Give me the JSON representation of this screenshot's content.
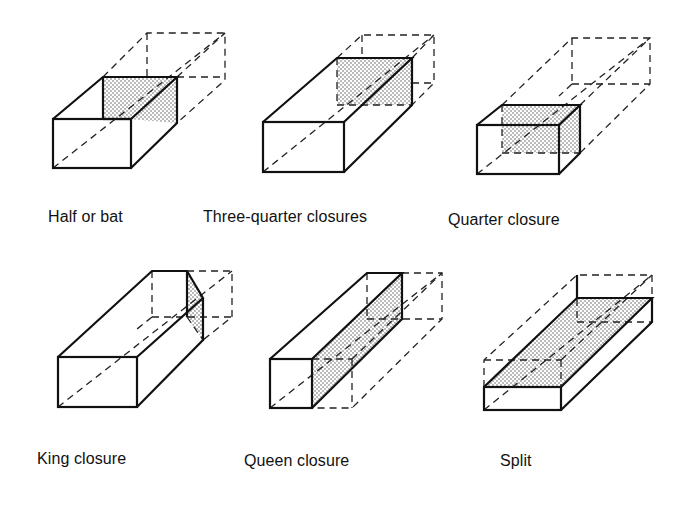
{
  "figure": {
    "panels": [
      {
        "id": "half-or-bat",
        "label": "Half or bat"
      },
      {
        "id": "three-quarter-closures",
        "label": "Three-quarter closures"
      },
      {
        "id": "quarter-closure",
        "label": "Quarter closure"
      },
      {
        "id": "king-closure",
        "label": "King closure"
      },
      {
        "id": "queen-closure",
        "label": "Queen closure"
      },
      {
        "id": "split",
        "label": "Split"
      }
    ]
  },
  "colors": {
    "line": "#111111",
    "background": "#ffffff",
    "shading_dots": "#555555"
  }
}
